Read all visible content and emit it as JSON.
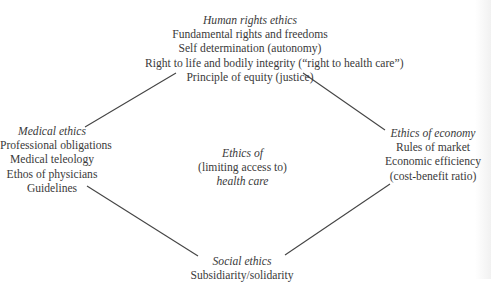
{
  "diagram": {
    "line_color": "#444444",
    "center": {
      "lines": [
        "Ethics of",
        "(limiting access to)",
        "health care"
      ],
      "italic": [
        true,
        false,
        true
      ]
    },
    "nodes": {
      "top": {
        "title": "Human rights ethics",
        "items": [
          "Fundamental rights and freedoms",
          "Self determination (autonomy)",
          "Right to life and bodily integrity (“right to health care”)",
          "Principle of equity (justice)"
        ]
      },
      "left": {
        "title": "Medical ethics",
        "items": [
          "Professional obligations",
          "Medical teleology",
          "Ethos of physicians",
          "Guidelines"
        ]
      },
      "right": {
        "title": "Ethics of economy",
        "items": [
          "Rules of market",
          "Economic efficiency",
          "(cost-benefit ratio)"
        ]
      },
      "bottom": {
        "title": "Social ethics",
        "items": [
          "Subsidiarity/solidarity"
        ]
      }
    },
    "connectors": [
      {
        "from": "left",
        "to": "top"
      },
      {
        "from": "top",
        "to": "right"
      },
      {
        "from": "left",
        "to": "bottom"
      },
      {
        "from": "bottom",
        "to": "right"
      }
    ]
  }
}
